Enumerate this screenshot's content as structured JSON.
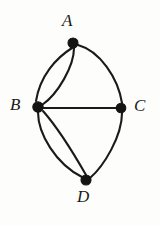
{
  "figure": {
    "kind": "hand-drawn-graph-diagram",
    "background_color": "#fdfdfc",
    "ink_color": "#1a1a1a",
    "width": 160,
    "height": 225
  },
  "graph": {
    "vertices": [
      {
        "id": "A",
        "label": "A",
        "x": 73,
        "y": 43,
        "radius": 5.0,
        "label_x": 62,
        "label_y": 12,
        "label_position": "above"
      },
      {
        "id": "B",
        "label": "B",
        "x": 38,
        "y": 107,
        "radius": 5.2,
        "label_x": 10,
        "label_y": 96,
        "label_position": "left"
      },
      {
        "id": "C",
        "label": "C",
        "x": 121,
        "y": 108,
        "radius": 4.8,
        "label_x": 134,
        "label_y": 97,
        "label_position": "right"
      },
      {
        "id": "D",
        "label": "D",
        "x": 86,
        "y": 180,
        "radius": 5.0,
        "label_x": 77,
        "label_y": 188,
        "label_position": "below"
      }
    ],
    "edges": [
      {
        "id": "AB1",
        "from": "A",
        "to": "B",
        "style": "curve-left",
        "stroke_width": 2.1,
        "path": "M 72 48 C 56 58, 40 76, 36 101"
      },
      {
        "id": "AB2",
        "from": "A",
        "to": "B",
        "style": "curve-right",
        "stroke_width": 2.1,
        "path": "M 74 48 C 74 66, 58 94, 42 105"
      },
      {
        "id": "AC1",
        "from": "A",
        "to": "C",
        "style": "curve-up",
        "stroke_width": 2.1,
        "path": "M 78 45 C 100 51, 118 78, 122 103"
      },
      {
        "id": "BC1",
        "from": "B",
        "to": "C",
        "style": "straight",
        "stroke_width": 2.0,
        "path": "M 43 108 L 117 108"
      },
      {
        "id": "BD1",
        "from": "B",
        "to": "D",
        "style": "curve-left",
        "stroke_width": 2.1,
        "path": "M 38 112 C 38 134, 56 164, 82 177"
      },
      {
        "id": "BD2",
        "from": "B",
        "to": "D",
        "style": "curve-right",
        "stroke_width": 2.1,
        "path": "M 43 111 C 58 128, 74 154, 86 175"
      },
      {
        "id": "CD1",
        "from": "C",
        "to": "D",
        "style": "curve-right",
        "stroke_width": 2.1,
        "path": "M 122 113 C 122 136, 104 166, 90 178"
      }
    ],
    "edge_count": 7,
    "vertex_count": 4,
    "multi_edge_pairs": [
      "A-B",
      "B-D"
    ]
  }
}
